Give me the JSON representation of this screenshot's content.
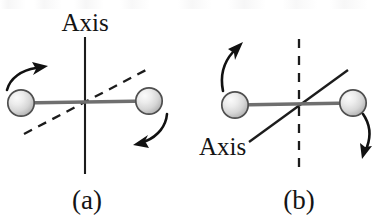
{
  "figure": {
    "background_color": "#ffffff",
    "ink_color": "#141414",
    "rod_color": "#6b6b6b",
    "sphere_fill_light": "#f2f2f2",
    "sphere_fill_mid": "#d9d9d9",
    "sphere_fill_dark": "#a8a8a8",
    "sphere_outline_color": "#4a4a4a",
    "width": 377,
    "height": 221
  },
  "panels": [
    {
      "id": "a",
      "label": "(a)",
      "axis_label": "Axis",
      "axis_orientation": "vertical-solid",
      "secondary_line": "diagonal-dashed",
      "arrows": [
        {
          "name": "upper-left-rotation-arrow",
          "direction": "up-right"
        },
        {
          "name": "lower-right-rotation-arrow",
          "direction": "down-left"
        }
      ],
      "spheres": [
        {
          "name": "left-sphere",
          "cx": 21,
          "cy": 103,
          "r": 13
        },
        {
          "name": "right-sphere",
          "cx": 149,
          "cy": 101,
          "r": 13
        }
      ]
    },
    {
      "id": "b",
      "label": "(b)",
      "axis_label": "Axis",
      "axis_orientation": "diagonal-solid",
      "secondary_line": "vertical-dashed",
      "arrows": [
        {
          "name": "upper-left-rotation-arrow",
          "direction": "up-right"
        },
        {
          "name": "lower-right-rotation-arrow",
          "direction": "down"
        }
      ],
      "spheres": [
        {
          "name": "left-sphere",
          "cx": 235,
          "cy": 105,
          "r": 13
        },
        {
          "name": "right-sphere",
          "cx": 353,
          "cy": 103,
          "r": 13
        }
      ]
    }
  ],
  "labels": {
    "panel_a_axis": "Axis",
    "panel_b_axis": "Axis",
    "panel_a_caption": "(a)",
    "panel_b_caption": "(b)"
  }
}
